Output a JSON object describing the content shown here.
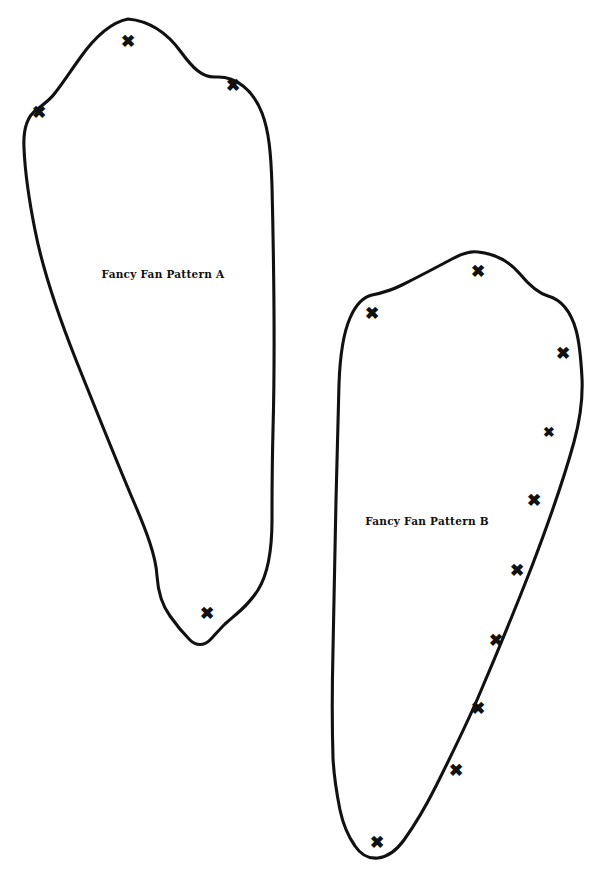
{
  "document": {
    "title": "Fancy Fan Pattern Template",
    "background_color": "#ffffff",
    "ink_color": "#111111",
    "width": 609,
    "height": 880
  },
  "pieces": [
    {
      "id": "pattern-a",
      "label": "Fancy Fan Pattern A",
      "label_x": 163,
      "label_y": 274,
      "outline": "M 128 19 C 150 21 168 34 181 52 C 192 67 202 78 216 77 C 236 76 253 90 262 113 C 269 131 271 154 272 186 C 274 270 275 360 273 430 C 272 468 272 494 272 520 C 272 552 268 574 258 590 C 248 606 236 614 225 624 C 219 630 214 636 210 640 C 204 646 196 646 190 640 C 184 634 177 626 170 616 C 162 605 158 592 157 576 C 156 556 146 530 133 500 C 116 460 96 410 76 360 C 57 312 42 266 35 230 C 29 200 25 172 24 148 C 23 129 27 117 36 110 C 44 104 50 100 55 93 C 62 84 70 72 80 58 C 92 41 108 23 128 19 Z",
      "marks": [
        {
          "name": "mark-a-1",
          "x": 128,
          "y": 41,
          "size": "normal"
        },
        {
          "name": "mark-a-2",
          "x": 233,
          "y": 85,
          "size": "normal"
        },
        {
          "name": "mark-a-3",
          "x": 39,
          "y": 112,
          "size": "normal"
        },
        {
          "name": "mark-a-4",
          "x": 207,
          "y": 613,
          "size": "normal"
        }
      ]
    },
    {
      "id": "pattern-b",
      "label": "Fancy Fan Pattern B",
      "label_x": 427,
      "label_y": 521,
      "outline": "M 478 252 C 497 254 510 262 520 274 C 529 285 538 293 548 296 C 562 300 571 312 576 330 C 580 344 581 360 582 378 C 583 400 580 420 574 442 C 563 482 548 524 532 566 C 514 612 495 658 477 700 C 462 734 448 762 436 786 C 425 808 414 826 404 840 C 396 851 387 857 378 858 C 369 859 361 855 355 846 C 348 836 343 824 340 810 C 337 795 334 778 333 758 C 332 726 332 690 333 650 C 334 600 335 548 336 500 C 337 452 338 414 339 384 C 340 356 343 334 350 318 C 356 304 363 297 372 295 C 382 293 392 290 402 285 C 418 277 437 267 452 259 C 461 254 470 251 478 252 Z",
      "marks": [
        {
          "name": "mark-b-1",
          "x": 478,
          "y": 271,
          "size": "normal"
        },
        {
          "name": "mark-b-2",
          "x": 372,
          "y": 313,
          "size": "normal"
        },
        {
          "name": "mark-b-3",
          "x": 563,
          "y": 353,
          "size": "normal"
        },
        {
          "name": "mark-b-4",
          "x": 549,
          "y": 432,
          "size": "small"
        },
        {
          "name": "mark-b-5",
          "x": 534,
          "y": 500,
          "size": "normal"
        },
        {
          "name": "mark-b-6",
          "x": 517,
          "y": 570,
          "size": "normal"
        },
        {
          "name": "mark-b-7",
          "x": 496,
          "y": 640,
          "size": "normal"
        },
        {
          "name": "mark-b-8",
          "x": 478,
          "y": 708,
          "size": "normal"
        },
        {
          "name": "mark-b-9",
          "x": 456,
          "y": 770,
          "size": "normal"
        },
        {
          "name": "mark-b-10",
          "x": 377,
          "y": 842,
          "size": "normal"
        }
      ]
    }
  ],
  "mark_glyph": "✖",
  "mark_symbol_name": "x-mark-icon"
}
